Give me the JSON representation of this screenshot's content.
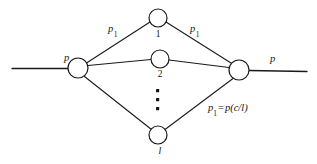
{
  "diagram": {
    "background_color": "#ffffff",
    "stroke_color": "#1a1a1a",
    "labels": {
      "p_left": "p",
      "p_right": "p",
      "p1_left": "p",
      "p1_left_sub": "1",
      "p1_right": "p",
      "p1_right_sub": "1",
      "node_top": "1",
      "node_middle": "2",
      "node_bottom": "l",
      "equation_lhs": "p",
      "equation_lhs_sub": "1",
      "equation_operator": "=",
      "equation_rhs": "p(c/l)"
    },
    "nodes": [
      {
        "id": "hub-left",
        "label": "",
        "cx": 78,
        "cy": 68,
        "r": 10
      },
      {
        "id": "branch-1",
        "label": "1",
        "cx": 158,
        "cy": 18,
        "r": 9
      },
      {
        "id": "branch-2",
        "label": "2",
        "cx": 160,
        "cy": 59,
        "r": 9
      },
      {
        "id": "branch-l",
        "label": "l",
        "cx": 158,
        "cy": 135,
        "r": 9
      },
      {
        "id": "hub-right",
        "label": "",
        "cx": 239,
        "cy": 70,
        "r": 10
      }
    ],
    "ellipsis_dots": 3
  }
}
